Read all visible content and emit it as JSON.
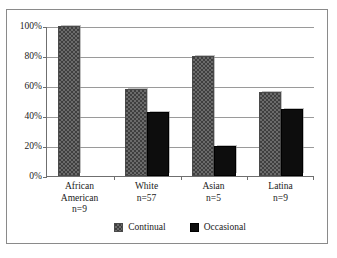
{
  "chart_data": {
    "type": "bar",
    "title": "",
    "subtitle": "",
    "xlabel": "",
    "ylabel": "",
    "ylim": [
      0,
      100
    ],
    "ytick_labels": [
      "100%",
      "80%",
      "60%",
      "40%",
      "20%",
      "0%"
    ],
    "ytick_values": [
      100,
      80,
      60,
      40,
      20,
      0
    ],
    "grid": true,
    "legend_position": "bottom-center",
    "categories": [
      "African American",
      "White",
      "Asian",
      "Latina"
    ],
    "category_lines": [
      [
        "African",
        "American",
        "n=9"
      ],
      [
        "White",
        "n=57"
      ],
      [
        "Asian",
        "n=5"
      ],
      [
        "Latina",
        "n=9"
      ]
    ],
    "sample_sizes": [
      "n=9",
      "n=57",
      "n=5",
      "n=9"
    ],
    "series": [
      {
        "name": "Continual",
        "color": "#6b6b6b",
        "pattern": "dotted",
        "values": [
          100,
          58,
          80,
          56
        ]
      },
      {
        "name": "Occasional",
        "color": "#0d0d0d",
        "pattern": "solid",
        "values": [
          0,
          43,
          20,
          44.5
        ]
      }
    ]
  },
  "legend": {
    "items": [
      {
        "label": "Continual"
      },
      {
        "label": "Occasional"
      }
    ]
  }
}
